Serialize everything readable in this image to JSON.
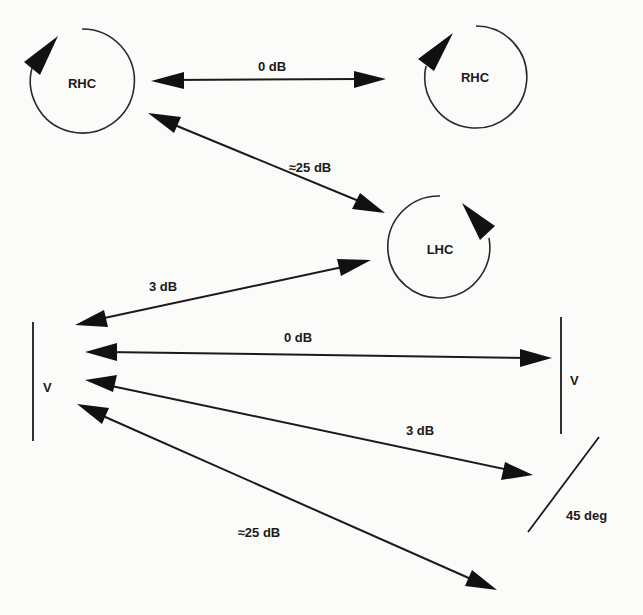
{
  "diagram": {
    "type": "polarization-mismatch-loss",
    "nodes": {
      "rhc_left": {
        "label": "RHC",
        "kind": "circular-polarization",
        "sense": "right-hand"
      },
      "rhc_right": {
        "label": "RHC",
        "kind": "circular-polarization",
        "sense": "right-hand"
      },
      "lhc": {
        "label": "LHC",
        "kind": "circular-polarization",
        "sense": "left-hand"
      },
      "v_left": {
        "label": "V",
        "kind": "linear-polarization",
        "orientation": "vertical"
      },
      "v_right": {
        "label": "V",
        "kind": "linear-polarization",
        "orientation": "vertical"
      },
      "slant45": {
        "label": "45  deg",
        "kind": "linear-polarization",
        "orientation": "45 degrees"
      }
    },
    "edges": [
      {
        "id": "rhc-rhc",
        "from": "rhc_left",
        "to": "rhc_right",
        "label": "0 dB"
      },
      {
        "id": "rhc-lhc",
        "from": "rhc_left",
        "to": "lhc",
        "label": "≈25 dB"
      },
      {
        "id": "v-lhc",
        "from": "v_left",
        "to": "lhc",
        "label": "3 dB"
      },
      {
        "id": "v-v",
        "from": "v_left",
        "to": "v_right",
        "label": "0 dB"
      },
      {
        "id": "v-45",
        "from": "v_left",
        "to": "slant45",
        "label": "3 dB"
      },
      {
        "id": "v-h",
        "from": "v_left",
        "to": "bottom-right",
        "label": "≈25 dB"
      }
    ],
    "colors": {
      "ink": "#1a1a1a",
      "background": "#fbfbf9"
    }
  }
}
